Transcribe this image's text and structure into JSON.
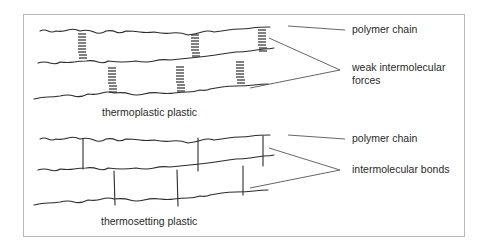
{
  "diagram": {
    "thermoplastic": {
      "caption": "thermoplastic plastic",
      "label_chain": "polymer chain",
      "label_forces_line1": "weak intermolecular",
      "label_forces_line2": "forces"
    },
    "thermosetting": {
      "caption": "thermosetting plastic",
      "label_chain": "polymer chain",
      "label_bonds": "intermolecular bonds"
    },
    "colors": {
      "line": "#2b2b2b",
      "leader": "#555555",
      "frame": "#b8b8b8",
      "text": "#2a2a2a"
    }
  }
}
